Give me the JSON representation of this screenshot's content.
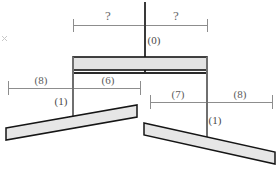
{
  "diagram": {
    "type": "engineering-dimension-diagram",
    "title": "",
    "background_color": "#ffffff",
    "top_dimension": {
      "left_label": "?",
      "right_label": "?",
      "center_label": "(0)"
    },
    "left_dimension": {
      "outer_label": "(8)",
      "inner_label": "(6)"
    },
    "right_dimension": {
      "inner_label": "(7)",
      "outer_label": "(8)"
    },
    "bar_labels": {
      "left": "(1)",
      "right": "(1)"
    },
    "colors": {
      "beam_fill": "#e3e3e3",
      "beam_stroke": "#141414",
      "bar_fill": "#e6e6e6",
      "bar_stroke": "#151515",
      "dimension_line": "#8d8d8d",
      "dimension_text": "#5c5c5c",
      "center_line": "#3a3a3a"
    }
  }
}
